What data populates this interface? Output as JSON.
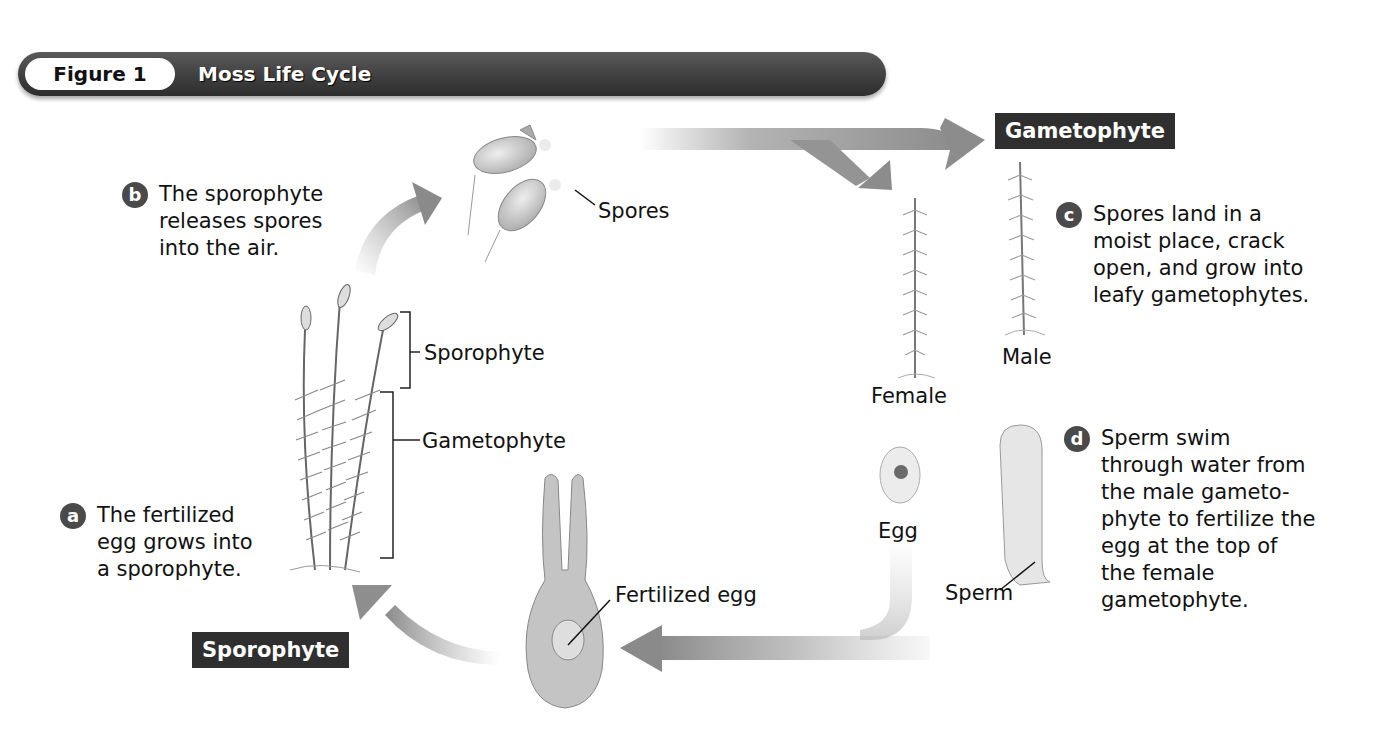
{
  "figure": {
    "number_label": "Figure 1",
    "title": "Moss Life Cycle"
  },
  "stage_labels": {
    "gametophyte": "Gametophyte",
    "sporophyte": "Sporophyte"
  },
  "steps": [
    {
      "badge": "a",
      "lines": [
        "The fertilized",
        "egg grows into",
        "a sporophyte."
      ]
    },
    {
      "badge": "b",
      "lines": [
        "The sporophyte",
        "releases spores",
        "into the air."
      ]
    },
    {
      "badge": "c",
      "lines": [
        "Spores land in a",
        "moist place, crack",
        "open, and grow into",
        "leafy gametophytes."
      ]
    },
    {
      "badge": "d",
      "lines": [
        "Sperm swim",
        "through water from",
        "the male gameto-",
        "phyte to fertilize the",
        "egg at the top of",
        "the female",
        "gametophyte."
      ]
    }
  ],
  "structure_labels": {
    "spores": "Spores",
    "sporophyte": "Sporophyte",
    "gametophyte": "Gametophyte",
    "female": "Female",
    "male": "Male",
    "egg": "Egg",
    "sperm": "Sperm",
    "fertilized_egg": "Fertilized egg"
  },
  "colors": {
    "banner": "#3d3d3d",
    "stage_label_bg": "#2f2f2f",
    "arrow": "#8a8a8a",
    "badge": "#4a4a4a"
  }
}
